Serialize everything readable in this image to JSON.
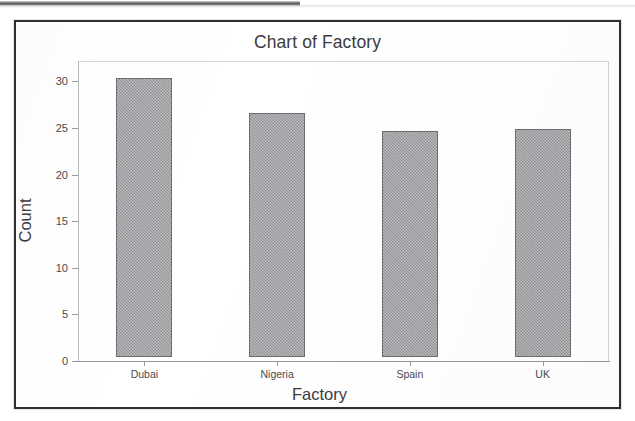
{
  "document": {
    "scan_artifact": "top-edge-scan-strip"
  },
  "chart_data": {
    "type": "bar",
    "title": "Chart of Factory",
    "xlabel": "Factory",
    "ylabel": "Count",
    "categories": [
      "Dubai",
      "Nigeria",
      "Spain",
      "UK"
    ],
    "values": [
      30.0,
      26.2,
      24.3,
      24.5
    ],
    "ylim": [
      0,
      32.2
    ],
    "yticks": [
      0,
      5,
      10,
      15,
      20,
      25,
      30
    ],
    "ytick_labels": [
      "0",
      "5",
      "10",
      "15",
      "20",
      "25",
      "30"
    ],
    "grid": false,
    "legend": null,
    "bar_color": "#9d9da1",
    "bar_edge_color": "#6e6e72",
    "axis_color": "#9a9a9e",
    "text_color": "#3b3b40",
    "background": "#ffffff"
  }
}
